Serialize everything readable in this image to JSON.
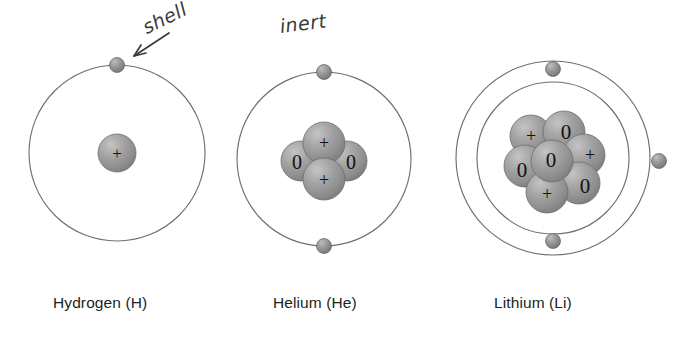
{
  "diagram": {
    "background_color": "#ffffff",
    "annotations": [
      {
        "id": "shell",
        "text": "shell",
        "kind": "handwritten",
        "points_to": "hydrogen-electron"
      },
      {
        "id": "inert",
        "text": "inert",
        "kind": "handwritten",
        "points_to": "helium-atom"
      }
    ],
    "colors": {
      "shell_line": "#6f6f6f",
      "nucleon_fill": "#9a9a9a",
      "nucleon_edge": "#6e6e6e",
      "electron_fill": "#8e8e8e",
      "electron_edge": "#5f5f5f",
      "symbol_text": "#111111",
      "label_text": "#201f1f",
      "annotation_text": "#3a3a3a"
    },
    "symbols": {
      "proton": "+",
      "neutron": "0",
      "electron": "–"
    },
    "atoms": [
      {
        "id": "hydrogen",
        "name": "Hydrogen",
        "symbol": "H",
        "label": "Hydrogen (H)",
        "center": {
          "x": 117,
          "y": 153
        },
        "shells": [
          {
            "index": 1,
            "radius": 88,
            "electron_count": 1
          }
        ],
        "electrons": [
          {
            "shell": 1,
            "angle_deg": 270,
            "symbol": "–"
          }
        ],
        "nucleus": {
          "protons": 1,
          "neutrons": 0,
          "nucleons": [
            {
              "type": "proton",
              "symbol": "+",
              "dx": 0,
              "dy": 0,
              "r": 19
            }
          ]
        }
      },
      {
        "id": "helium",
        "name": "Helium",
        "symbol": "He",
        "label": "Helium (He)",
        "center": {
          "x": 324,
          "y": 159
        },
        "shells": [
          {
            "index": 1,
            "radius": 87,
            "electron_count": 2
          }
        ],
        "electrons": [
          {
            "shell": 1,
            "angle_deg": 270,
            "symbol": "–"
          },
          {
            "shell": 1,
            "angle_deg": 90,
            "symbol": "–"
          }
        ],
        "nucleus": {
          "protons": 2,
          "neutrons": 2,
          "nucleons": [
            {
              "type": "neutron",
              "symbol": "0",
              "dx": -23,
              "dy": 2,
              "r": 20
            },
            {
              "type": "neutron",
              "symbol": "0",
              "dx": 23,
              "dy": 2,
              "r": 20
            },
            {
              "type": "proton",
              "symbol": "+",
              "dx": 0,
              "dy": -16,
              "r": 21
            },
            {
              "type": "proton",
              "symbol": "+",
              "dx": 0,
              "dy": 20,
              "r": 21
            }
          ]
        }
      },
      {
        "id": "lithium",
        "name": "Lithium",
        "symbol": "Li",
        "label": "Lithium (Li)",
        "center": {
          "x": 553,
          "y": 158
        },
        "shells": [
          {
            "index": 1,
            "radius": 76,
            "electron_count": 2
          },
          {
            "index": 2,
            "radius": 97,
            "electron_count": 1
          }
        ],
        "electrons": [
          {
            "shell": 1,
            "angle_deg": 270,
            "symbol": "–"
          },
          {
            "shell": 1,
            "angle_deg": 90,
            "symbol": "–"
          },
          {
            "shell": 2,
            "angle_deg": 0,
            "symbol": "–"
          }
        ],
        "nucleus": {
          "protons": 3,
          "neutrons": 4,
          "nucleons": [
            {
              "type": "proton",
              "symbol": "+",
              "dx": -22,
              "dy": -22,
              "r": 21
            },
            {
              "type": "neutron",
              "symbol": "0",
              "dx": 11,
              "dy": -26,
              "r": 21
            },
            {
              "type": "proton",
              "symbol": "+",
              "dx": 31,
              "dy": -3,
              "r": 21
            },
            {
              "type": "neutron",
              "symbol": "0",
              "dx": -28,
              "dy": 8,
              "r": 21
            },
            {
              "type": "neutron",
              "symbol": "0",
              "dx": -1,
              "dy": 3,
              "r": 21
            },
            {
              "type": "neutron",
              "symbol": "0",
              "dx": 26,
              "dy": 25,
              "r": 21
            },
            {
              "type": "proton",
              "symbol": "+",
              "dx": -6,
              "dy": 34,
              "r": 21
            }
          ]
        }
      }
    ]
  }
}
